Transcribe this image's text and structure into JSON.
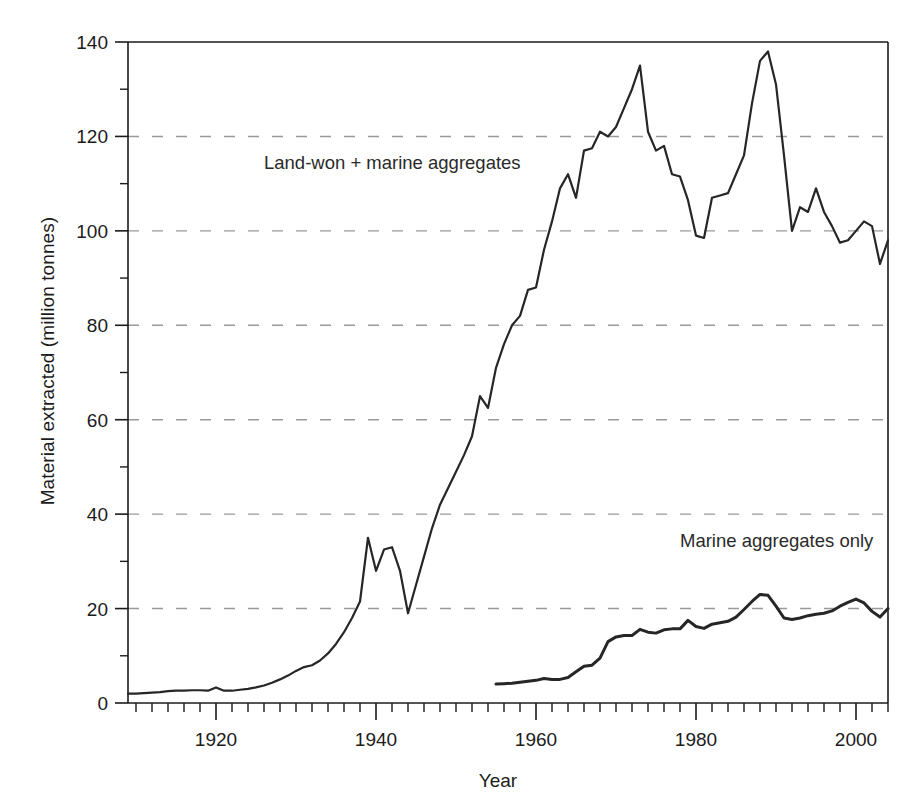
{
  "chart_data": {
    "type": "line",
    "title": "",
    "xlabel": "Year",
    "ylabel": "Material extracted (million tonnes)",
    "xlim": [
      1909,
      2004
    ],
    "ylim": [
      0,
      140
    ],
    "xticks": [
      1920,
      1940,
      1960,
      1980,
      2000
    ],
    "xtick_labels": [
      "1920",
      "1940",
      "1960",
      "1980",
      "2000"
    ],
    "xminor_step": 2,
    "yticks": [
      0,
      20,
      40,
      60,
      80,
      100,
      120,
      140
    ],
    "ytick_labels": [
      "0",
      "20",
      "40",
      "60",
      "80",
      "100",
      "120",
      "140"
    ],
    "yminor": [
      10,
      30,
      50,
      70,
      90,
      110,
      130
    ],
    "grid": "horizontal-dashed",
    "gridlines": [
      20,
      40,
      60,
      80,
      100,
      120
    ],
    "legend_position": "inline-annotations",
    "line_color": "#262626",
    "grid_color": "#9a9a9a",
    "axis_color": "#1b1b1b",
    "background": "#ffffff",
    "annotations": [
      {
        "name": "land-won-plus-marine-label",
        "text": "Land-won + marine aggregates",
        "x": 1926,
        "y": 113
      },
      {
        "name": "marine-only-label",
        "text": "Marine aggregates only",
        "x": 1978,
        "y": 33
      }
    ],
    "series": [
      {
        "name": "Land-won + marine aggregates",
        "x": [
          1909,
          1910,
          1911,
          1912,
          1913,
          1914,
          1915,
          1916,
          1917,
          1918,
          1919,
          1920,
          1921,
          1922,
          1923,
          1924,
          1925,
          1926,
          1927,
          1928,
          1929,
          1930,
          1931,
          1932,
          1933,
          1934,
          1935,
          1936,
          1937,
          1938,
          1939,
          1940,
          1941,
          1942,
          1943,
          1944,
          1945,
          1946,
          1947,
          1948,
          1949,
          1950,
          1951,
          1952,
          1953,
          1954,
          1955,
          1956,
          1957,
          1958,
          1959,
          1960,
          1961,
          1962,
          1963,
          1964,
          1965,
          1966,
          1967,
          1968,
          1969,
          1970,
          1971,
          1972,
          1973,
          1974,
          1975,
          1976,
          1977,
          1978,
          1979,
          1980,
          1981,
          1982,
          1983,
          1984,
          1985,
          1986,
          1987,
          1988,
          1989,
          1990,
          1991,
          1992,
          1993,
          1994,
          1995,
          1996,
          1997,
          1998,
          1999,
          2000,
          2001,
          2002,
          2003,
          2004
        ],
        "values": [
          2.0,
          2.0,
          2.1,
          2.2,
          2.3,
          2.5,
          2.6,
          2.6,
          2.7,
          2.7,
          2.6,
          3.3,
          2.6,
          2.6,
          2.8,
          3.0,
          3.3,
          3.7,
          4.3,
          5.0,
          5.8,
          6.8,
          7.6,
          8.0,
          9.0,
          10.5,
          12.5,
          15.0,
          18.0,
          21.5,
          35.0,
          28.0,
          32.5,
          33.0,
          28.0,
          19.0,
          25.0,
          31.0,
          37.0,
          42.0,
          45.5,
          49.0,
          52.5,
          56.5,
          65.0,
          62.5,
          71.0,
          76.0,
          80.0,
          82.0,
          87.5,
          88.0,
          96.0,
          102.0,
          109.0,
          112.0,
          107.0,
          117.0,
          117.5,
          121.0,
          120.0,
          122.0,
          126.0,
          130.0,
          135.0,
          121.0,
          117.0,
          118.0,
          112.0,
          111.5,
          106.5,
          99.0,
          98.5,
          107.0,
          107.5,
          108.0,
          112.0,
          116.0,
          127.0,
          136.0,
          138.0,
          131.0,
          116.0,
          100.0,
          105.0,
          104.0,
          109.0,
          104.0,
          101.0,
          97.5,
          98.0,
          100.0,
          102.0,
          101.0,
          93.0,
          98.0
        ]
      },
      {
        "name": "Marine aggregates only",
        "x": [
          1955,
          1956,
          1957,
          1958,
          1959,
          1960,
          1961,
          1962,
          1963,
          1964,
          1965,
          1966,
          1967,
          1968,
          1969,
          1970,
          1971,
          1972,
          1973,
          1974,
          1975,
          1976,
          1977,
          1978,
          1979,
          1980,
          1981,
          1982,
          1983,
          1984,
          1985,
          1986,
          1987,
          1988,
          1989,
          1990,
          1991,
          1992,
          1993,
          1994,
          1995,
          1996,
          1997,
          1998,
          1999,
          2000,
          2001,
          2002,
          2003,
          2004
        ],
        "values": [
          4.0,
          4.1,
          4.2,
          4.4,
          4.6,
          4.8,
          5.2,
          5.0,
          5.0,
          5.4,
          6.6,
          7.8,
          8.0,
          9.5,
          13.0,
          14.0,
          14.3,
          14.3,
          15.6,
          15.0,
          14.8,
          15.5,
          15.7,
          15.7,
          17.5,
          16.2,
          15.8,
          16.7,
          17.0,
          17.3,
          18.2,
          19.8,
          21.5,
          23.0,
          22.8,
          20.5,
          18.0,
          17.7,
          18.0,
          18.5,
          18.8,
          19.0,
          19.5,
          20.5,
          21.3,
          22.0,
          21.2,
          19.4,
          18.2,
          20.0
        ]
      }
    ]
  }
}
